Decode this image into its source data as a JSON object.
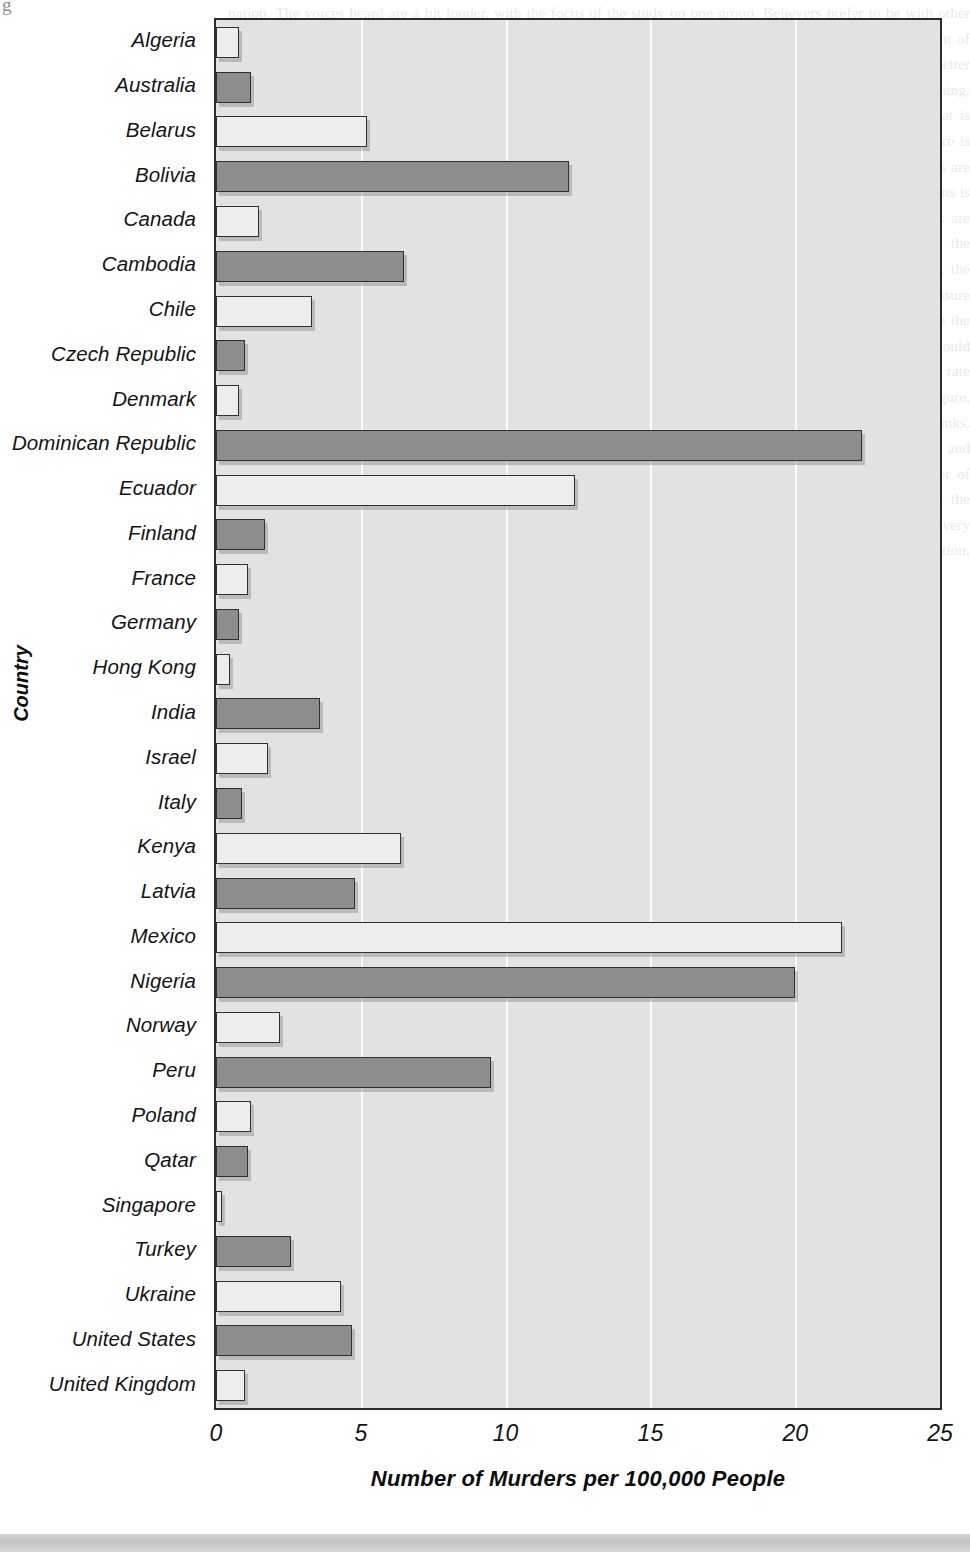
{
  "page": {
    "corner_glyph": "g",
    "ghost_text": "nation. The voices heard are a bit louder, with the focus of the study on one group. Believers prefer to be with other believers, and there are more places where they hear the Lord. Having an emphasis on a particular measurement of belief. The ones in a small number of cases, and the way that a person may listen and be able to make a better choice, show the group or an organization. There are some of the cases with the general conditions of nothing. Considering that you want to discuss the difference in the groups, a chance is given to be specific about what is presented in the figure. A comparison is presented for a group of nations on the measure that is presented. Here is the measurement in the number of events that occur, scaled to a common base so that the places greater and less are seen. The measurement of the number presented is above 20 in only a handful of cases, while a number of nations is below two, which means that the comparison differences are quite broad. Consider also the way that events are added to the comparison of the nations in the figure. The rate for the United States is in the middle of the distribution, and the way that readers usually think about it is not what the chart shows. In this set of data, the largest number is in the Dominican Republic. The figure also shows the range that the discussion requires a measure across all the other nations that are shown. Only a few countries take in individual deaths, and this is shown in the chart. For a very large population, the number can still be small because the rate is what matters. The readers would take the time to consider what changes when the base of the measure is changed from an absolute count to a rate per person. The difference is often large, and the comparison is then reversed. For a number of nations in the figure, the shown bar is much longer than one would expect and the one for others is much shorter than one thinks. Considering that when we compare across nations, we look at a number using a scale of the kind shown here, and that a rate is one of the best ways to do so. Be careful about the way you look at this chart for any number of nations shown, for a count of events. Every one of the nations in the figure, in Europe, Asia, Africa, and the Americas, is not immune from the issues discussed here. It is an example of the kind of comparison that can be very useful to the audience. As shown in the figure, the rate of the United States is a value within the normal distribution, but not at all what many readers believe."
  },
  "chart_data": {
    "type": "bar",
    "orientation": "horizontal",
    "title": "",
    "xlabel": "Number of Murders per 100,000 People",
    "ylabel": "Country",
    "xlim": [
      0,
      25
    ],
    "xticks": [
      0,
      5,
      10,
      15,
      20,
      25
    ],
    "xtick_labels": [
      "0",
      "5",
      "10",
      "15",
      "20",
      "25"
    ],
    "grid": true,
    "grid_axis": "x",
    "legend": null,
    "categories": [
      "Algeria",
      "Australia",
      "Belarus",
      "Bolivia",
      "Canada",
      "Cambodia",
      "Chile",
      "Czech Republic",
      "Denmark",
      "Dominican Republic",
      "Ecuador",
      "Finland",
      "France",
      "Germany",
      "Hong Kong",
      "India",
      "Israel",
      "Italy",
      "Kenya",
      "Latvia",
      "Mexico",
      "Nigeria",
      "Norway",
      "Peru",
      "Poland",
      "Qatar",
      "Singapore",
      "Turkey",
      "Ukraine",
      "United States",
      "United Kingdom"
    ],
    "values": [
      0.8,
      1.2,
      5.2,
      12.2,
      1.5,
      6.5,
      3.3,
      1.0,
      0.8,
      22.3,
      12.4,
      1.7,
      1.1,
      0.8,
      0.5,
      3.6,
      1.8,
      0.9,
      6.4,
      4.8,
      21.6,
      20.0,
      2.2,
      9.5,
      1.2,
      1.1,
      0.2,
      2.6,
      4.3,
      4.7,
      1.0
    ],
    "bar_shades": [
      "light",
      "dark",
      "light",
      "dark",
      "light",
      "dark",
      "light",
      "dark",
      "light",
      "dark",
      "light",
      "dark",
      "light",
      "dark",
      "light",
      "dark",
      "light",
      "dark",
      "light",
      "dark",
      "light",
      "dark",
      "light",
      "dark",
      "light",
      "dark",
      "light",
      "dark",
      "light",
      "dark",
      "light"
    ],
    "colors": {
      "bar_light": "#ededed",
      "bar_dark": "#8d8d8d",
      "bar_edge": "#2f2f2f",
      "plot_background": "#e2e2e2",
      "gridline": "#fbfbfb",
      "frame": "#2b2b2b",
      "text": "#141414"
    }
  }
}
